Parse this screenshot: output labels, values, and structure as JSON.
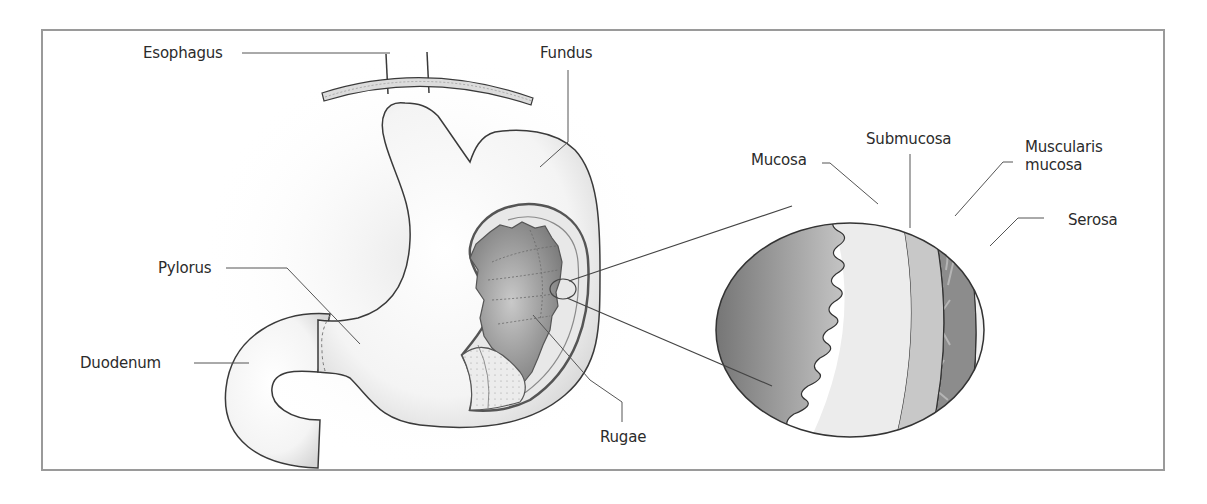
{
  "figure": {
    "type": "anatomical-diagram",
    "colors": {
      "frame": "#9a9a9a",
      "outline": "#3a3a3a",
      "leader_line": "#555555",
      "label_text": "#2b2b2b",
      "mucosa_inner_dark": "#7a7a7a",
      "mucosa": "#ececec",
      "submucosa": "#c8c8c8",
      "muscularis": "#8c8c8c",
      "serosa": "#f2f2f2"
    }
  },
  "labels": {
    "esophagus": "Esophagus",
    "fundus": "Fundus",
    "pylorus": "Pylorus",
    "duodenum": "Duodenum",
    "rugae": "Rugae",
    "mucosa": "Mucosa",
    "submucosa": "Submucosa",
    "muscularis_line1": "Muscularis",
    "muscularis_line2": "mucosa",
    "serosa": "Serosa"
  }
}
